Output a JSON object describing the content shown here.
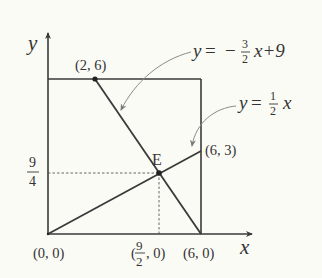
{
  "colors": {
    "background": "#fbfbf6",
    "line": "#3a3a3a",
    "leader": "#8a8a8a",
    "text": "#333333"
  },
  "axes": {
    "x_label": "x",
    "y_label": "y"
  },
  "equations": {
    "line1": {
      "lhs": "y",
      "eq": "=",
      "sign": "−",
      "num": "3",
      "den": "2",
      "rest": "x+9"
    },
    "line2": {
      "lhs": "y",
      "eq": "=",
      "num": "1",
      "den": "2",
      "rest": "x"
    }
  },
  "points": {
    "origin": "(0, 0)",
    "p26": "(2, 6)",
    "p63": "(6, 3)",
    "p60": "(6, 0)",
    "E": "E",
    "xE": {
      "open": "(",
      "num": "9",
      "den": "2",
      "close": ", 0)"
    },
    "yE": {
      "num": "9",
      "den": "4"
    }
  },
  "figure": {
    "square": {
      "x_min": 0,
      "x_max": 6,
      "y_min": 0,
      "y_max": 6
    },
    "segments": [
      {
        "name": "y=-3/2x+9",
        "from": [
          2,
          6
        ],
        "to": [
          6,
          0
        ]
      },
      {
        "name": "y=1/2x",
        "from": [
          0,
          0
        ],
        "to": [
          6,
          3
        ]
      }
    ],
    "intersection_E": [
      4.5,
      2.25
    ]
  }
}
